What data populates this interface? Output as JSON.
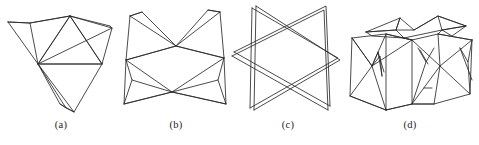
{
  "figure": {
    "background_color": "#ffffff",
    "line_color": "#2a2a2a",
    "caption_color": "#1b1b1b",
    "panels": [
      {
        "id": "a",
        "caption": "(a)",
        "viewbox": "0 0 118 118",
        "polylines": [
          "6,22 28,23 68,16 108,26",
          "6,22 36,64 68,16",
          "68,16 36,64 110,28",
          "6,22 28,23 36,64",
          "28,23 68,16",
          "36,64 100,64 68,16",
          "36,64 100,64",
          "100,64 110,28 68,16",
          "108,26 110,28",
          "36,64 72,112 100,64",
          "36,64 64,108 72,112",
          "36,64 58,104 64,108",
          "58,104 72,112",
          "68,16 100,64"
        ]
      },
      {
        "id": "b",
        "caption": "(b)",
        "viewbox": "0 0 112 118",
        "polylines": [
          "10,16 56,46 100,12",
          "10,16 22,12 56,46",
          "100,12 88,10 56,46",
          "10,16 6,60 56,46",
          "100,12 104,58 56,46",
          "6,60 56,46 104,58",
          "6,60 52,92 104,58",
          "6,60 12,80 52,92",
          "104,58 98,80 52,92",
          "6,60 4,104 52,92",
          "104,58 106,104 52,92",
          "4,104 52,92 106,104",
          "12,80 4,104",
          "98,80 106,104",
          "22,12 10,16",
          "88,10 100,12"
        ]
      },
      {
        "id": "c",
        "caption": "(c)",
        "viewbox": "0 0 116 118",
        "polylines": [
          "22,8 108,58 20,108",
          "22,8 20,108",
          "26,6 110,60 24,110",
          "26,6 24,110",
          "4,52 96,6 100,106",
          "4,52 100,106",
          "2,56 94,10 98,110",
          "2,56 98,110"
        ]
      },
      {
        "id": "d",
        "caption": "(d)",
        "viewbox": "0 0 136 118",
        "polylines": [
          "24,32 58,18 72,30 96,16 124,26",
          "24,32 54,30 58,18",
          "58,18 54,30 72,30",
          "72,30 96,16 100,30",
          "96,16 124,26 100,30",
          "24,32 54,30 62,38 100,30 124,26",
          "24,32 30,36 62,38",
          "100,30 110,36 124,26",
          "10,38 44,34 70,40 96,34 130,40",
          "10,38 8,96 44,110",
          "44,34 44,110",
          "70,40 70,104 44,110",
          "10,38 30,66 44,34",
          "30,66 44,110",
          "30,66 70,40",
          "10,38 30,66 8,96",
          "8,96 44,110",
          "70,40 98,66 96,34",
          "98,66 70,104",
          "98,66 130,40",
          "130,40 128,94 98,66",
          "96,34 130,40",
          "30,66 36,52 42,72",
          "30,66 38,56 40,76",
          "36,52 40,76",
          "76,48 84,62 92,48",
          "78,50 86,64",
          "70,104 84,62",
          "44,110 70,104 92,104 128,94",
          "70,104 92,104",
          "98,66 92,104",
          "118,48 126,62 130,40",
          "118,48 130,80",
          "126,62 128,94",
          "44,34 70,40",
          "62,38 70,40",
          "100,30 96,34",
          "82,88 90,88"
        ]
      }
    ]
  }
}
